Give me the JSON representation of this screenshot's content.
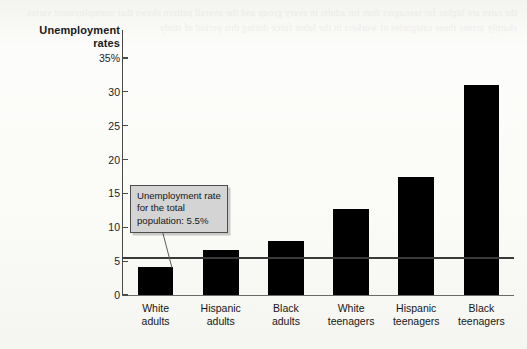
{
  "chart_data": {
    "type": "bar",
    "title": "Unemployment rates",
    "title_line1": "Unemployment",
    "title_line2": "rates",
    "xlabel": "",
    "ylabel": "Unemployment rates",
    "ylim": [
      0,
      35
    ],
    "grid": false,
    "legend": null,
    "categories": [
      "White adults",
      "Hispanic adults",
      "Black adults",
      "White teenagers",
      "Hispanic teenagers",
      "Black teenagers"
    ],
    "category_lines": [
      [
        "White",
        "adults"
      ],
      [
        "Hispanic",
        "adults"
      ],
      [
        "Black",
        "adults"
      ],
      [
        "White",
        "teenagers"
      ],
      [
        "Hispanic",
        "teenagers"
      ],
      [
        "Black",
        "teenagers"
      ]
    ],
    "values": [
      4.2,
      6.6,
      8.0,
      12.7,
      17.5,
      31.0
    ],
    "bar_color": "#000000",
    "ytick_labels": [
      "35%",
      "30",
      "25",
      "20",
      "15",
      "10",
      "5",
      "0"
    ],
    "ytick_values": [
      35,
      30,
      25,
      20,
      15,
      10,
      5,
      0
    ],
    "annotations": [
      {
        "name": "total-population-reference",
        "text": "Unemployment rate for the total population: 5.5%",
        "line1": "Unemployment",
        "line2": "rate for the total",
        "line3": "population: 5.5%",
        "value": 5.5,
        "reference_line": true,
        "line_color": "#3a3a3a",
        "box_fill": "#d4d4d4",
        "box_border": "#4d4d4d"
      }
    ]
  },
  "page": {
    "background": "#fbfbf9",
    "bleed_text": "the rates are higher for teenagers than for adults in every group and the overall pattern shows that unemployment varies sharply across these categories of workers in the labor force during this period of study"
  }
}
